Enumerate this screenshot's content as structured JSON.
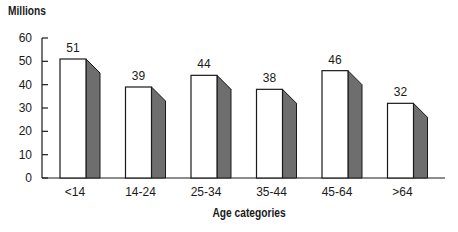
{
  "chart_data": {
    "type": "bar",
    "title": "",
    "ylabel": "Millions",
    "xlabel": "Age categories",
    "categories": [
      "<14",
      "14-24",
      "25-34",
      "35-44",
      "45-64",
      ">64"
    ],
    "values": [
      51,
      39,
      44,
      38,
      46,
      32
    ],
    "data_labels": [
      "51",
      "39",
      "44",
      "38",
      "46",
      "32"
    ],
    "ylim": [
      0,
      60
    ],
    "yticks": [
      0,
      10,
      20,
      30,
      40,
      50,
      60
    ],
    "grid": false,
    "legend": null,
    "style": "3d-bar-with-dark-gray-side",
    "colors": {
      "bar_face": "#ffffff",
      "bar_side": "#6e6e6e",
      "outline": "#1a1a1a"
    }
  }
}
